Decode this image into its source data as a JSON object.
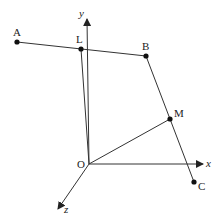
{
  "diagram": {
    "axes": {
      "x_label": "x",
      "y_label": "y",
      "z_label": "z",
      "origin_label": "O"
    },
    "points": [
      {
        "name": "A",
        "label": "A"
      },
      {
        "name": "L",
        "label": "L"
      },
      {
        "name": "B",
        "label": "B"
      },
      {
        "name": "M",
        "label": "M"
      },
      {
        "name": "C",
        "label": "C"
      }
    ],
    "segments": [
      "A-B",
      "B-C",
      "O-L",
      "O-M"
    ],
    "colors": {
      "line": "#333333",
      "text": "#222222",
      "background": "#ffffff"
    }
  }
}
